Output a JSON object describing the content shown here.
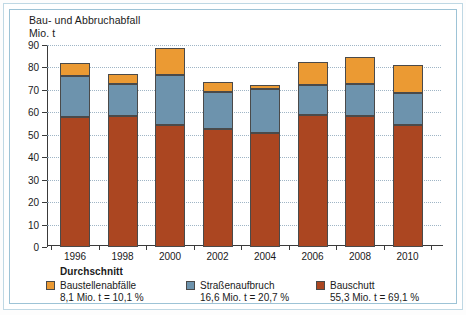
{
  "chart_data": {
    "type": "bar",
    "title": "Bau- und Abbruchabfall",
    "subtitle": "Mio. t",
    "xlabel": "",
    "ylabel": "Mio. t",
    "ylim": [
      0,
      90
    ],
    "ytick_step": 10,
    "grid": true,
    "stacked": true,
    "legend_position": "bottom",
    "legend_heading": "Durchschnitt",
    "categories": [
      "1996",
      "1998",
      "2000",
      "2002",
      "2004",
      "2006",
      "2008",
      "2010"
    ],
    "yticks": [
      "0",
      "10",
      "20",
      "30",
      "40",
      "50",
      "60",
      "70",
      "80",
      "90"
    ],
    "series": [
      {
        "name": "Bauschutt",
        "color": "#ab4621",
        "average_label": "55,3 Mio. t = 69,1 %",
        "average_value": 55.3,
        "average_share_pct": 69.1,
        "values": [
          58.0,
          58.5,
          54.5,
          52.5,
          51.0,
          59.0,
          58.5,
          54.5
        ]
      },
      {
        "name": "Straßenaufbruch",
        "color": "#6d93ad",
        "average_label": "16,6 Mio. t = 20,7 %",
        "average_value": 16.6,
        "average_share_pct": 20.7,
        "values": [
          18.0,
          14.0,
          22.0,
          16.5,
          19.5,
          13.0,
          14.0,
          14.0
        ]
      },
      {
        "name": "Baustellenabfälle",
        "color": "#eb9a33",
        "average_label": "8,1 Mio. t = 10,1 %",
        "average_value": 8.1,
        "average_share_pct": 10.1,
        "values": [
          6.0,
          4.5,
          12.0,
          4.5,
          1.5,
          10.5,
          12.0,
          12.5
        ]
      }
    ],
    "totals": [
      82.0,
      77.0,
      88.5,
      73.5,
      72.0,
      82.5,
      84.5,
      81.0
    ]
  },
  "legend": {
    "heading": "Durchschnitt",
    "items": [
      {
        "label": "Baustellenabfälle",
        "value": "8,1 Mio. t = 10,1 %",
        "color": "#eb9a33"
      },
      {
        "label": "Straßenaufbruch",
        "value": "16,6 Mio. t = 20,7 %",
        "color": "#6d93ad"
      },
      {
        "label": "Bauschutt",
        "value": "55,3 Mio. t = 69,1 %",
        "color": "#ab4621"
      }
    ]
  }
}
